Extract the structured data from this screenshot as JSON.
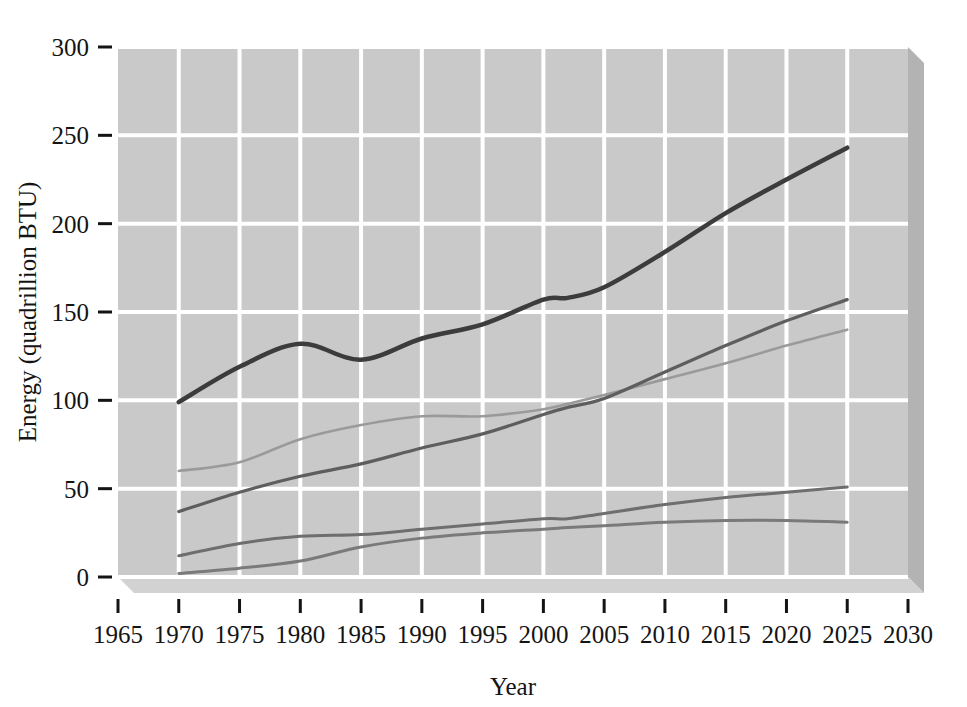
{
  "chart_data": {
    "type": "line",
    "title": "",
    "xlabel": "Year",
    "ylabel": "Energy (quadrillion BTU)",
    "xlim": [
      1965,
      2030
    ],
    "ylim": [
      0,
      300
    ],
    "xticks": [
      1965,
      1970,
      1975,
      1980,
      1985,
      1990,
      1995,
      2000,
      2005,
      2010,
      2015,
      2020,
      2025,
      2030
    ],
    "yticks": [
      0,
      50,
      100,
      150,
      200,
      250,
      300
    ],
    "xtick_labels": [
      "1965",
      "1970",
      "1975",
      "1980",
      "1985",
      "1990",
      "1995",
      "2000",
      "2005",
      "2010",
      "2015",
      "2020",
      "2025",
      "2030"
    ],
    "ytick_labels": [
      "0",
      "50",
      "100",
      "150",
      "200",
      "250",
      "300"
    ],
    "grid": true,
    "grid_color": "#ffffff",
    "plot_background": "#c9c9c9",
    "legend": "none",
    "legend_position": "none",
    "x": [
      1970,
      1975,
      1980,
      1985,
      1990,
      1995,
      2000,
      2002,
      2005,
      2010,
      2015,
      2020,
      2025
    ],
    "series": [
      {
        "name": "total-energy",
        "color": "#3c3c3c",
        "width": 4.5,
        "values": [
          99,
          119,
          132,
          123,
          135,
          143,
          157,
          158,
          164,
          184,
          206,
          225,
          243
        ]
      },
      {
        "name": "series-second-dark",
        "color": "#5e5e5e",
        "width": 3.2,
        "values": [
          37,
          48,
          57,
          64,
          73,
          81,
          92,
          96,
          101,
          116,
          131,
          145,
          157
        ]
      },
      {
        "name": "series-light-gray",
        "color": "#9a9a9a",
        "width": 2.6,
        "values": [
          60,
          65,
          78,
          86,
          91,
          91,
          95,
          98,
          103,
          112,
          121,
          131,
          140
        ]
      },
      {
        "name": "series-fourth",
        "color": "#6e6e6e",
        "width": 3.0,
        "values": [
          12,
          19,
          23,
          24,
          27,
          30,
          33,
          33,
          36,
          41,
          45,
          48,
          51
        ]
      },
      {
        "name": "series-fifth",
        "color": "#7a7a7a",
        "width": 3.0,
        "values": [
          2,
          5,
          9,
          17,
          22,
          25,
          27,
          28,
          29,
          31,
          32,
          32,
          31
        ]
      }
    ]
  }
}
